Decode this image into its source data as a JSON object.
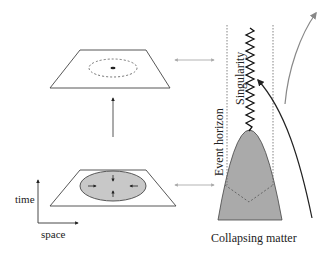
{
  "labels": {
    "time": "time",
    "space": "space",
    "event_horizon": "Event horizon",
    "singularity": "Singularity",
    "collapsing_matter": "Collapsing matter"
  },
  "colors": {
    "line": "#333333",
    "gray_line": "#888888",
    "matter_fill": "#aaaaaa",
    "ellipse_fill": "#c8c8c8",
    "dashed": "#666666",
    "background": "#ffffff"
  },
  "panels": {
    "left": {
      "top_plane": {
        "description": "spacetime slice with dashed circle and central point"
      },
      "bottom_plane": {
        "description": "spacetime slice with gray collapsing region and inward arrows"
      }
    },
    "right": {
      "description": "Penrose-style collapse diagram: parabola of collapsing matter, singularity zigzag, event horizon dashed lines, light rays"
    }
  }
}
